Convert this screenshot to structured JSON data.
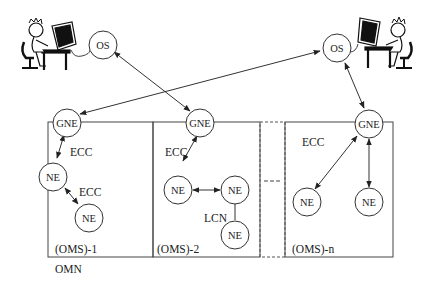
{
  "diagram": {
    "operators": [
      {
        "id": "operator-left",
        "desc": "person at computer terminal (left)"
      },
      {
        "id": "operator-right",
        "desc": "person at computer terminal (right)"
      }
    ],
    "nodes": {
      "os_left": "OS",
      "os_right": "OS",
      "gne_1": "GNE",
      "gne_2": "GNE",
      "gne_n": "GNE",
      "ne_1a": "NE",
      "ne_1b": "NE",
      "ne_2a": "NE",
      "ne_2b": "NE",
      "ne_2c": "NE",
      "ne_na": "NE",
      "ne_nb": "NE"
    },
    "labels": {
      "ecc_1a": "ECC",
      "ecc_1b": "ECC",
      "ecc_2": "ECC",
      "ecc_n": "ECC",
      "lcn": "LCN"
    },
    "sections": {
      "oms_1": "(OMS)-1",
      "oms_2": "(OMS)-2",
      "oms_n": "(OMS)-n"
    },
    "network_label": "OMN",
    "edges": [
      {
        "from": "os_left",
        "to": "gne_2",
        "type": "bidirectional"
      },
      {
        "from": "os_right",
        "to": "gne_1",
        "type": "bidirectional"
      },
      {
        "from": "os_right",
        "to": "gne_n",
        "type": "bidirectional"
      },
      {
        "from": "gne_1",
        "to": "ne_1a",
        "type": "bidirectional",
        "label": "ECC"
      },
      {
        "from": "ne_1a",
        "to": "ne_1b",
        "type": "bidirectional",
        "label": "ECC"
      },
      {
        "from": "gne_2",
        "to": "ne_2a",
        "type": "bidirectional",
        "label": "ECC"
      },
      {
        "from": "ne_2a",
        "to": "ne_2b",
        "type": "bidirectional"
      },
      {
        "from": "ne_2b",
        "to": "ne_2c",
        "type": "line",
        "label": "LCN"
      },
      {
        "from": "gne_n",
        "to": "ne_na",
        "type": "bidirectional",
        "label": "ECC"
      },
      {
        "from": "gne_n",
        "to": "ne_nb",
        "type": "bidirectional"
      }
    ]
  }
}
